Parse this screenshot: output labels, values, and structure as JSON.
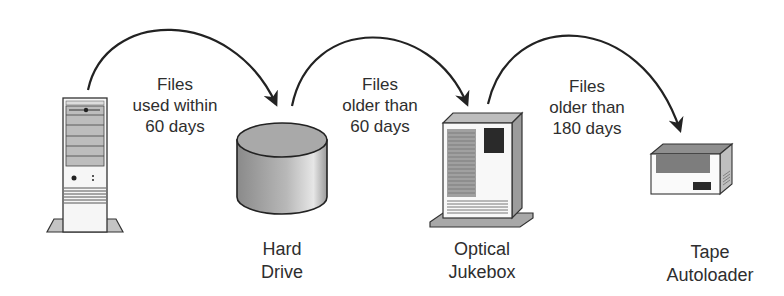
{
  "diagram": {
    "nodes": [
      {
        "id": "server",
        "label_lines": [],
        "icon": "server-tower-icon"
      },
      {
        "id": "hard-drive",
        "label_lines": [
          "Hard",
          "Drive"
        ],
        "icon": "hard-drive-cylinder-icon"
      },
      {
        "id": "optical-jukebox",
        "label_lines": [
          "Optical",
          "Jukebox"
        ],
        "icon": "optical-jukebox-icon"
      },
      {
        "id": "tape-autoloader",
        "label_lines": [
          "Tape",
          "Autoloader"
        ],
        "icon": "tape-autoloader-icon"
      }
    ],
    "edges": [
      {
        "from": "server",
        "to": "hard-drive",
        "label_lines": [
          "Files",
          "used within",
          "60 days"
        ]
      },
      {
        "from": "hard-drive",
        "to": "optical-jukebox",
        "label_lines": [
          "Files",
          "older than",
          "60 days"
        ]
      },
      {
        "from": "optical-jukebox",
        "to": "tape-autoloader",
        "label_lines": [
          "Files",
          "older than",
          "180 days"
        ]
      }
    ]
  }
}
